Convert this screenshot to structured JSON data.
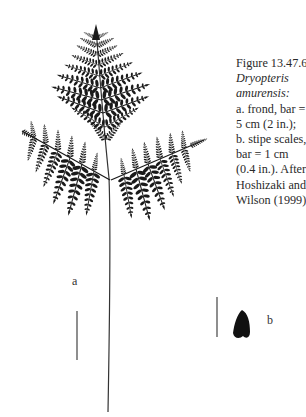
{
  "figure": {
    "caption_lines": [
      {
        "text": "Figure 13.47.6.",
        "italic": false
      },
      {
        "text": "Dryopteris",
        "italic": true
      },
      {
        "text": "amurensis:",
        "italic": true
      },
      {
        "text": "a. frond, bar =",
        "italic": false
      },
      {
        "text": "5 cm (2 in.);",
        "italic": false
      },
      {
        "text": "b. stipe scales,",
        "italic": false
      },
      {
        "text": "bar = 1 cm",
        "italic": false
      },
      {
        "text": "(0.4 in.). After",
        "italic": false
      },
      {
        "text": "Hoshizaki and",
        "italic": false
      },
      {
        "text": "Wilson (1999).",
        "italic": false
      }
    ],
    "panel_labels": {
      "a": "a",
      "b": "b"
    },
    "scale_bars": {
      "a": {
        "represents": "5 cm (2 in.)"
      },
      "b": {
        "represents": "1 cm (0.4 in.)"
      }
    },
    "colors": {
      "ink": "#1a1a1a",
      "text": "#2a2a2a",
      "background": "#ffffff"
    }
  }
}
